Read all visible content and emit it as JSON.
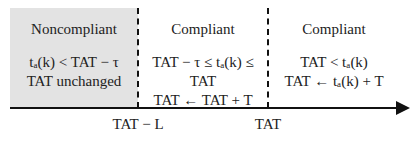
{
  "regions": [
    {
      "title": "Noncompliant",
      "condition": "tₐ(k) < TAT − τ",
      "action": "TAT unchanged"
    },
    {
      "title": "Compliant",
      "condition": "TAT − τ ≤ tₐ(k) ≤ TAT",
      "action": "TAT ← TAT + T"
    },
    {
      "title": "Compliant",
      "condition": "TAT < tₐ(k)",
      "action": "TAT ← tₐ(k) + T"
    }
  ],
  "axis": {
    "ticks": [
      {
        "label": "TAT − L"
      },
      {
        "label": "TAT"
      }
    ]
  },
  "colors": {
    "noncompliant_fill": "#e3e3e3",
    "line": "#111111"
  }
}
